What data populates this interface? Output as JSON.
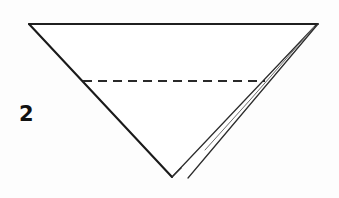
{
  "figure": {
    "step_label": "2",
    "canvas": {
      "width": 339,
      "height": 198,
      "background": "#fdfdfd"
    },
    "colors": {
      "ink": "#1a1a1a",
      "ink_thin": "#2c2c2c",
      "ink_faint": "#6d6d6d",
      "fold_line": "#2a2a2a",
      "paper": "#ffffff",
      "label": "#111111"
    },
    "vertices": {
      "top_left": {
        "x": 29,
        "y": 24
      },
      "top_right": {
        "x": 318,
        "y": 24
      },
      "bottom_apex": {
        "x": 172,
        "y": 177
      },
      "flap_bottom": {
        "x": 188,
        "y": 178
      },
      "fold_left": {
        "x": 83,
        "y": 81
      },
      "fold_right": {
        "x": 265,
        "y": 81
      }
    },
    "elements": {
      "top_edge_name": "top-edge",
      "left_edge_name": "left-edge",
      "right_edge_name": "right-edge",
      "flap_edge_name": "flap-edge",
      "fold_line_name": "dashed-fold-line"
    }
  }
}
